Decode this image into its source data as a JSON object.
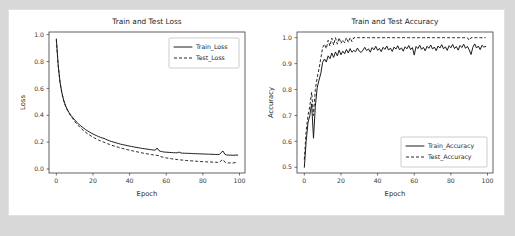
{
  "figure": {
    "background": "#ffffff",
    "outer_background": "#d8d8d8",
    "line_color": "#1c1c1c"
  },
  "chart_data": [
    {
      "type": "line",
      "title": "Train and Test Loss",
      "xlabel": "Epoch",
      "ylabel": "Loss",
      "xlim": [
        -4,
        103
      ],
      "ylim": [
        -0.03,
        1.02
      ],
      "xticks": [
        0,
        20,
        40,
        60,
        80,
        100
      ],
      "yticks": [
        0.0,
        0.2,
        0.4,
        0.6,
        0.8,
        1.0
      ],
      "xticklabels": [
        "0",
        "20",
        "40",
        "60",
        "80",
        "100"
      ],
      "yticklabels": [
        "0.0",
        "0.2",
        "0.4",
        "0.6",
        "0.8",
        "1.0"
      ],
      "grid": false,
      "legend_position": "upper right",
      "series": [
        {
          "name": "Train_Loss",
          "style": "solid",
          "x": [
            0,
            1,
            2,
            3,
            4,
            5,
            6,
            7,
            8,
            9,
            10,
            11,
            12,
            13,
            14,
            15,
            16,
            17,
            18,
            19,
            20,
            21,
            22,
            23,
            24,
            25,
            26,
            27,
            28,
            29,
            30,
            31,
            32,
            33,
            34,
            35,
            36,
            37,
            38,
            39,
            40,
            41,
            42,
            43,
            44,
            45,
            46,
            47,
            48,
            49,
            50,
            51,
            52,
            53,
            54,
            55,
            56,
            57,
            58,
            59,
            60,
            61,
            62,
            63,
            64,
            65,
            66,
            67,
            68,
            69,
            70,
            71,
            72,
            73,
            74,
            75,
            76,
            77,
            78,
            79,
            80,
            81,
            82,
            83,
            84,
            85,
            86,
            87,
            88,
            89,
            90,
            91,
            92,
            93,
            94,
            95,
            96,
            97,
            98,
            99
          ],
          "values": [
            0.968,
            0.775,
            0.648,
            0.569,
            0.513,
            0.472,
            0.443,
            0.419,
            0.399,
            0.382,
            0.366,
            0.35,
            0.337,
            0.325,
            0.314,
            0.303,
            0.293,
            0.284,
            0.276,
            0.268,
            0.261,
            0.254,
            0.248,
            0.241,
            0.236,
            0.231,
            0.228,
            0.221,
            0.215,
            0.21,
            0.205,
            0.201,
            0.197,
            0.193,
            0.189,
            0.185,
            0.182,
            0.179,
            0.176,
            0.173,
            0.17,
            0.168,
            0.165,
            0.162,
            0.16,
            0.158,
            0.155,
            0.153,
            0.151,
            0.149,
            0.147,
            0.145,
            0.143,
            0.141,
            0.14,
            0.156,
            0.137,
            0.131,
            0.128,
            0.126,
            0.125,
            0.124,
            0.123,
            0.122,
            0.121,
            0.121,
            0.12,
            0.126,
            0.119,
            0.118,
            0.117,
            0.117,
            0.116,
            0.116,
            0.115,
            0.114,
            0.114,
            0.113,
            0.113,
            0.112,
            0.112,
            0.111,
            0.111,
            0.11,
            0.11,
            0.109,
            0.109,
            0.108,
            0.108,
            0.108,
            0.123,
            0.133,
            0.11,
            0.104,
            0.103,
            0.103,
            0.102,
            0.102,
            0.104,
            0.103
          ]
        },
        {
          "name": "Test_Loss",
          "style": "dashed",
          "x": [
            0,
            1,
            2,
            3,
            4,
            5,
            6,
            7,
            8,
            9,
            10,
            11,
            12,
            13,
            14,
            15,
            16,
            17,
            18,
            19,
            20,
            21,
            22,
            23,
            24,
            25,
            26,
            27,
            28,
            29,
            30,
            31,
            32,
            33,
            34,
            35,
            36,
            37,
            38,
            39,
            40,
            41,
            42,
            43,
            44,
            45,
            46,
            47,
            48,
            49,
            50,
            51,
            52,
            53,
            54,
            55,
            56,
            57,
            58,
            59,
            60,
            61,
            62,
            63,
            64,
            65,
            66,
            67,
            68,
            69,
            70,
            71,
            72,
            73,
            74,
            75,
            76,
            77,
            78,
            79,
            80,
            81,
            82,
            83,
            84,
            85,
            86,
            87,
            88,
            89,
            90,
            91,
            92,
            93,
            94,
            95,
            96,
            97,
            98,
            99
          ],
          "values": [
            0.962,
            0.772,
            0.645,
            0.566,
            0.509,
            0.468,
            0.438,
            0.414,
            0.393,
            0.374,
            0.355,
            0.338,
            0.323,
            0.309,
            0.296,
            0.284,
            0.273,
            0.263,
            0.254,
            0.245,
            0.237,
            0.23,
            0.223,
            0.216,
            0.21,
            0.204,
            0.199,
            0.193,
            0.188,
            0.183,
            0.178,
            0.173,
            0.169,
            0.165,
            0.161,
            0.157,
            0.153,
            0.15,
            0.146,
            0.143,
            0.14,
            0.137,
            0.134,
            0.131,
            0.128,
            0.125,
            0.122,
            0.119,
            0.117,
            0.114,
            0.112,
            0.109,
            0.107,
            0.105,
            0.103,
            0.101,
            0.099,
            0.092,
            0.088,
            0.085,
            0.082,
            0.08,
            0.078,
            0.076,
            0.074,
            0.072,
            0.07,
            0.069,
            0.067,
            0.066,
            0.064,
            0.063,
            0.062,
            0.061,
            0.06,
            0.059,
            0.058,
            0.057,
            0.056,
            0.055,
            0.054,
            0.054,
            0.053,
            0.052,
            0.052,
            0.051,
            0.05,
            0.05,
            0.049,
            0.049,
            0.062,
            0.07,
            0.051,
            0.046,
            0.045,
            0.045,
            0.044,
            0.046,
            0.048,
            0.047
          ]
        }
      ]
    },
    {
      "type": "line",
      "title": "Train and Test Accuracy",
      "xlabel": "Epoch",
      "ylabel": "Accuracy",
      "xlim": [
        -4,
        103
      ],
      "ylim": [
        0.478,
        1.022
      ],
      "xticks": [
        0,
        20,
        40,
        60,
        80,
        100
      ],
      "yticks": [
        0.5,
        0.6,
        0.7,
        0.8,
        0.9,
        1.0
      ],
      "xticklabels": [
        "0",
        "20",
        "40",
        "60",
        "80",
        "100"
      ],
      "yticklabels": [
        "0.5",
        "0.6",
        "0.7",
        "0.8",
        "0.9",
        "1.0"
      ],
      "grid": false,
      "legend_position": "lower right",
      "series": [
        {
          "name": "Train_Accuracy",
          "style": "solid",
          "x": [
            0,
            1,
            2,
            3,
            4,
            5,
            6,
            7,
            8,
            9,
            10,
            11,
            12,
            13,
            14,
            15,
            16,
            17,
            18,
            19,
            20,
            21,
            22,
            23,
            24,
            25,
            26,
            27,
            28,
            29,
            30,
            31,
            32,
            33,
            34,
            35,
            36,
            37,
            38,
            39,
            40,
            41,
            42,
            43,
            44,
            45,
            46,
            47,
            48,
            49,
            50,
            51,
            52,
            53,
            54,
            55,
            56,
            57,
            58,
            59,
            60,
            61,
            62,
            63,
            64,
            65,
            66,
            67,
            68,
            69,
            70,
            71,
            72,
            73,
            74,
            75,
            76,
            77,
            78,
            79,
            80,
            81,
            82,
            83,
            84,
            85,
            86,
            87,
            88,
            89,
            90,
            91,
            92,
            93,
            94,
            95,
            96,
            97,
            98,
            99
          ],
          "values": [
            0.5,
            0.6,
            0.672,
            0.7,
            0.745,
            0.612,
            0.735,
            0.806,
            0.836,
            0.862,
            0.905,
            0.918,
            0.906,
            0.93,
            0.919,
            0.941,
            0.924,
            0.945,
            0.93,
            0.952,
            0.934,
            0.948,
            0.938,
            0.955,
            0.941,
            0.958,
            0.944,
            0.951,
            0.946,
            0.96,
            0.948,
            0.943,
            0.952,
            0.963,
            0.95,
            0.957,
            0.944,
            0.962,
            0.953,
            0.967,
            0.951,
            0.959,
            0.946,
            0.963,
            0.955,
            0.968,
            0.952,
            0.96,
            0.947,
            0.964,
            0.956,
            0.969,
            0.953,
            0.961,
            0.948,
            0.965,
            0.957,
            0.97,
            0.954,
            0.962,
            0.933,
            0.966,
            0.958,
            0.971,
            0.955,
            0.963,
            0.949,
            0.967,
            0.959,
            0.972,
            0.956,
            0.964,
            0.95,
            0.968,
            0.96,
            0.973,
            0.957,
            0.965,
            0.951,
            0.969,
            0.961,
            0.974,
            0.958,
            0.966,
            0.952,
            0.97,
            0.962,
            0.975,
            0.959,
            0.967,
            0.953,
            0.935,
            0.963,
            0.976,
            0.96,
            0.968,
            0.954,
            0.971,
            0.964,
            0.966
          ]
        },
        {
          "name": "Test_Accuracy",
          "style": "dashed",
          "x": [
            0,
            1,
            2,
            3,
            4,
            5,
            6,
            7,
            8,
            9,
            10,
            11,
            12,
            13,
            14,
            15,
            16,
            17,
            18,
            19,
            20,
            21,
            22,
            23,
            24,
            25,
            26,
            27,
            28,
            29,
            30,
            31,
            32,
            33,
            34,
            35,
            36,
            37,
            38,
            39,
            40,
            41,
            42,
            43,
            44,
            45,
            46,
            47,
            48,
            49,
            50,
            51,
            52,
            53,
            54,
            55,
            56,
            57,
            58,
            59,
            60,
            61,
            62,
            63,
            64,
            65,
            66,
            67,
            68,
            69,
            70,
            71,
            72,
            73,
            74,
            75,
            76,
            77,
            78,
            79,
            80,
            81,
            82,
            83,
            84,
            85,
            86,
            87,
            88,
            89,
            90,
            91,
            92,
            93,
            94,
            95,
            96,
            97,
            98,
            99
          ],
          "values": [
            0.53,
            0.64,
            0.7,
            0.735,
            0.79,
            0.7,
            0.8,
            0.845,
            0.88,
            0.92,
            0.962,
            0.975,
            0.958,
            0.99,
            0.968,
            0.998,
            0.972,
            1.0,
            0.975,
            1.0,
            0.978,
            0.992,
            0.98,
            1.0,
            0.982,
            1.0,
            0.985,
            1.0,
            1.0,
            1.0,
            1.0,
            1.0,
            1.0,
            1.0,
            1.0,
            1.0,
            1.0,
            1.0,
            1.0,
            1.0,
            1.0,
            1.0,
            1.0,
            1.0,
            1.0,
            1.0,
            1.0,
            1.0,
            1.0,
            1.0,
            1.0,
            1.0,
            1.0,
            1.0,
            1.0,
            1.0,
            1.0,
            1.0,
            1.0,
            1.0,
            1.0,
            1.0,
            1.0,
            1.0,
            1.0,
            1.0,
            1.0,
            1.0,
            1.0,
            1.0,
            1.0,
            1.0,
            1.0,
            1.0,
            1.0,
            1.0,
            1.0,
            1.0,
            1.0,
            1.0,
            1.0,
            1.0,
            1.0,
            1.0,
            1.0,
            1.0,
            1.0,
            1.0,
            1.0,
            1.0,
            0.99,
            1.0,
            1.0,
            1.0,
            1.0,
            1.0,
            1.0,
            1.0,
            1.0,
            1.0
          ]
        }
      ]
    }
  ]
}
